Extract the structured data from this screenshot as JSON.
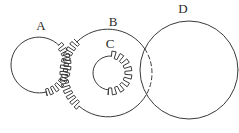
{
  "diagram": {
    "type": "gear-diagram",
    "background": "#ffffff",
    "line_color": "#3a3a3a",
    "label_color": "#2b2b2b",
    "canvas": {
      "width": 239,
      "height": 133
    },
    "labels": [
      {
        "id": "A",
        "text": "A",
        "x": 41,
        "y": 30
      },
      {
        "id": "B",
        "text": "B",
        "x": 113,
        "y": 26
      },
      {
        "id": "C",
        "text": "C",
        "x": 110,
        "y": 48
      },
      {
        "id": "D",
        "text": "D",
        "x": 183,
        "y": 13
      }
    ],
    "gears": [
      {
        "id": "A",
        "name": "circle-a",
        "cx": 39,
        "cy": 65,
        "r": 28,
        "segments": [
          {
            "type": "teeth",
            "from": -45,
            "to": 75,
            "pitch": 12,
            "outer": 4,
            "inner": 3
          },
          {
            "type": "smooth",
            "from": 75,
            "to": 315
          }
        ]
      },
      {
        "id": "B",
        "name": "circle-b",
        "cx": 108,
        "cy": 73,
        "r": 44,
        "segments": [
          {
            "type": "smooth",
            "from": 30,
            "to": 131
          },
          {
            "type": "teeth",
            "from": 131,
            "to": 225,
            "pitch": 8,
            "outer": 4,
            "inner": 3.5
          },
          {
            "type": "smooth",
            "from": 225,
            "to": 327
          },
          {
            "type": "dashed",
            "from": 327,
            "to": 390
          }
        ]
      },
      {
        "id": "C",
        "name": "circle-c",
        "cx": 110,
        "cy": 73,
        "r": 17,
        "segments": [
          {
            "type": "teeth",
            "from": -85,
            "to": 95,
            "pitch": 22,
            "outer": 5,
            "inner": 2
          },
          {
            "type": "smooth",
            "from": 95,
            "to": 275
          }
        ]
      },
      {
        "id": "D",
        "name": "circle-d",
        "cx": 189,
        "cy": 70,
        "r": 49,
        "segments": [
          {
            "type": "smooth",
            "from": 0,
            "to": 360
          }
        ]
      }
    ]
  }
}
